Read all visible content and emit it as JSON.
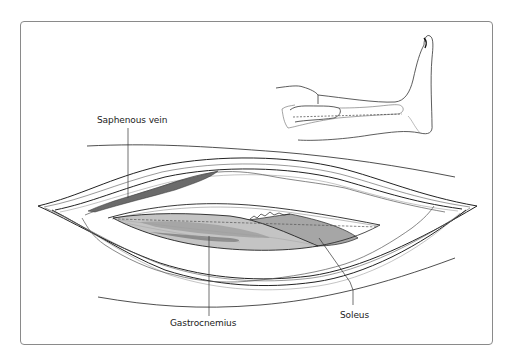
{
  "figure": {
    "labels": {
      "saphenous_vein": "Saphenous vein",
      "gastrocnemius": "Gastrocnemius",
      "soleus": "Soleus"
    },
    "colors": {
      "frame_border": "#8a8a8a",
      "outline": "#222222",
      "vein_fill": "#6b6b6b",
      "muscle_fill_light": "#c4c4c4",
      "muscle_fill_mid": "#a6a6a6",
      "muscle_fill_dark": "#8c8c8c",
      "fat_line": "#9a9a9a"
    },
    "inset": {
      "description": "Lateral view of lower leg and foot with dashed incision line"
    }
  }
}
